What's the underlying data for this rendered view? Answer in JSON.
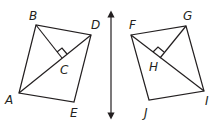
{
  "diagram": {
    "left_figure": {
      "vertices": {
        "A": [
          19,
          93
        ],
        "B": [
          36,
          25
        ],
        "D": [
          91,
          35
        ],
        "E": [
          74,
          102
        ]
      },
      "intersection": {
        "C": [
          62,
          61
        ]
      },
      "labels": {
        "A": "A",
        "B": "B",
        "C": "C",
        "D": "D",
        "E": "E"
      }
    },
    "right_figure": {
      "vertices": {
        "F": [
          131,
          35
        ],
        "G": [
          186,
          26
        ],
        "I": [
          204,
          91
        ],
        "J": [
          149,
          100
        ]
      },
      "intersection": {
        "H": [
          163,
          59
        ]
      },
      "labels": {
        "F": "F",
        "G": "G",
        "H": "H",
        "I": "I",
        "J": "J"
      }
    },
    "line_of_reflection": {
      "x": 111,
      "y1": 12,
      "y2": 118
    }
  }
}
